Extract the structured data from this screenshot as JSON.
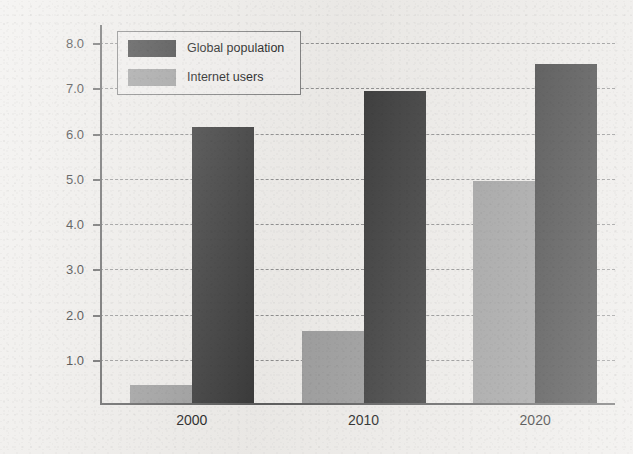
{
  "chart_data": {
    "type": "bar",
    "title": "",
    "xlabel": "",
    "ylabel": "Number of people (billions)",
    "categories": [
      "2000",
      "2010",
      "2020"
    ],
    "series": [
      {
        "name": "Internet users",
        "values": [
          0.4,
          1.6,
          4.9
        ],
        "color": "#9b9b9b"
      },
      {
        "name": "Global population",
        "values": [
          6.1,
          6.9,
          7.5
        ],
        "color": "#3a3a3a"
      }
    ],
    "ylim": [
      0,
      8.4
    ],
    "yticks": [
      1.0,
      2.0,
      3.0,
      4.0,
      5.0,
      6.0,
      7.0,
      8.0
    ],
    "ytick_labels": [
      "1.0",
      "2.0",
      "3.0",
      "4.0",
      "5.0",
      "6.0",
      "7.0",
      "8.0"
    ],
    "grid": true,
    "grid_style": "dashed",
    "legend_position": "upper left",
    "background_color": "#eceae7"
  },
  "legend": {
    "entries": [
      {
        "label": "Global population",
        "color": "#3a3a3a"
      },
      {
        "label": "Internet users",
        "color": "#9b9b9b"
      }
    ]
  }
}
